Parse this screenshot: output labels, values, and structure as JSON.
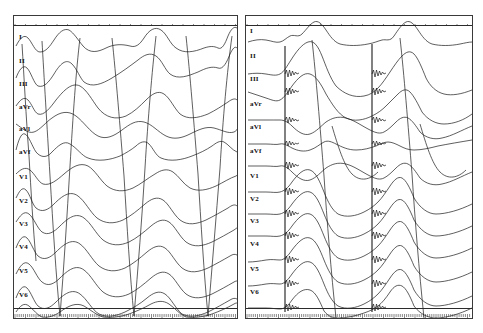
{
  "figure": {
    "background_color": "#ffffff",
    "trace_color": "#1a1a1a",
    "frame_color": "#3a3a3a",
    "width_px": 483,
    "height_px": 333
  },
  "panels": [
    {
      "id": "panel-left",
      "name": "left-ecg-panel",
      "label": "",
      "x": 13,
      "y": 15,
      "width": 225,
      "height": 304,
      "has_top_ruler": true,
      "has_bottom_ruler": true,
      "pacing_spikes": false,
      "leads": [
        {
          "label": "I",
          "y": 38
        },
        {
          "label": "II",
          "y": 62
        },
        {
          "label": "III",
          "y": 85
        },
        {
          "label": "aVr",
          "y": 108
        },
        {
          "label": "aVl",
          "y": 130
        },
        {
          "label": "aVf",
          "y": 153
        },
        {
          "label": "V1",
          "y": 178
        },
        {
          "label": "V2",
          "y": 202
        },
        {
          "label": "V3",
          "y": 225
        },
        {
          "label": "V4",
          "y": 248
        },
        {
          "label": "V5",
          "y": 272
        },
        {
          "label": "V6",
          "y": 296
        }
      ]
    },
    {
      "id": "panel-right",
      "name": "right-ecg-panel",
      "label": "",
      "x": 245,
      "y": 15,
      "width": 228,
      "height": 304,
      "has_top_ruler": true,
      "has_bottom_ruler": true,
      "pacing_spikes": true,
      "pacing_spike_x": [
        39,
        126
      ],
      "leads": [
        {
          "label": "I",
          "y": 32
        },
        {
          "label": "II",
          "y": 57
        },
        {
          "label": "III",
          "y": 80
        },
        {
          "label": "aVr",
          "y": 105
        },
        {
          "label": "aVl",
          "y": 128
        },
        {
          "label": "aVf",
          "y": 152
        },
        {
          "label": "V1",
          "y": 177
        },
        {
          "label": "V2",
          "y": 200
        },
        {
          "label": "V3",
          "y": 222
        },
        {
          "label": "V4",
          "y": 245
        },
        {
          "label": "V5",
          "y": 270
        },
        {
          "label": "V6",
          "y": 293
        }
      ]
    }
  ],
  "chart_data": {
    "type": "line",
    "xlabel": "Time",
    "ylabel": "Amplitude",
    "grid": false,
    "legend_position": "left-inline-labels",
    "lead_order": [
      "I",
      "II",
      "III",
      "aVr",
      "aVl",
      "aVf",
      "V1",
      "V2",
      "V3",
      "V4",
      "V5",
      "V6"
    ],
    "panels": [
      {
        "name": "left",
        "beats": 3,
        "beat_x_positions": [
          55,
          125,
          200
        ],
        "paced": false,
        "notes": "Wide, slurred QRS complexes with large amplitude deflections crossing multiple lead channels"
      },
      {
        "name": "right",
        "beats": 2,
        "beat_x_positions": [
          39,
          126
        ],
        "paced": true,
        "notes": "Vertical pacing spike artifacts with high-frequency oscillation preceding each QRS"
      }
    ]
  }
}
